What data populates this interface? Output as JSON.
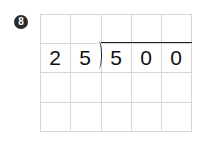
{
  "problem": {
    "number_label": "8",
    "divisor": [
      "2",
      "5"
    ],
    "dividend": [
      "5",
      "0",
      "0"
    ]
  },
  "grid": {
    "columns": 5,
    "rows": 4,
    "line_color": "#d8d8d8"
  }
}
